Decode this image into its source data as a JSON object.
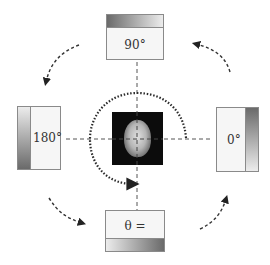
{
  "diagram": {
    "type": "rotation-orientation-diagram",
    "boxes": {
      "top": {
        "label": "90°",
        "gradient_side": "top",
        "gradient_direction": "dark-left-to-light-right"
      },
      "left": {
        "label": "180°",
        "gradient_side": "left",
        "gradient_direction": "light-top-to-dark-bottom"
      },
      "right": {
        "label": "0°",
        "gradient_side": "right",
        "gradient_direction": "dark-top-to-light-bottom"
      },
      "bottom": {
        "label": "θ =",
        "gradient_side": "bottom",
        "gradient_direction": "light-left-to-dark-right"
      }
    },
    "center_image": {
      "description": "axial brain MRI slice",
      "icon": "brain-scan-image"
    },
    "crosshair": {
      "style": "dashed",
      "color": "#555555"
    },
    "rotation_arc": {
      "style": "dotted",
      "direction": "clockwise",
      "color": "#333333"
    },
    "cycle_arrows": {
      "style": "dashed",
      "color": "#333333",
      "items": [
        {
          "from": "top",
          "to": "left"
        },
        {
          "from": "left",
          "to": "bottom"
        },
        {
          "from": "bottom",
          "to": "right"
        },
        {
          "from": "right",
          "to": "top"
        }
      ]
    },
    "colors": {
      "box_border": "#8a8a8a",
      "box_fill": "#f6f6f6",
      "gradient_dark": "#6a6a6a",
      "gradient_light": "#ececec"
    }
  }
}
